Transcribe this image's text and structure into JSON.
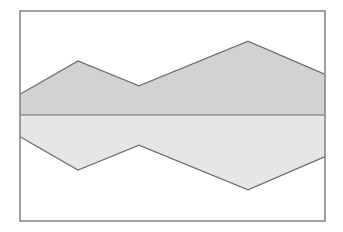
{
  "chart_data": {
    "type": "area",
    "title": "",
    "xlabel": "",
    "ylabel": "",
    "grid": false,
    "legend": null,
    "x": [
      0,
      1,
      2,
      3,
      4
    ],
    "baseline": 0,
    "ylim": [
      -100,
      100
    ],
    "series": [
      {
        "name": "upper",
        "direction": "above-baseline",
        "values": [
          20,
          52,
          28,
          71,
          39
        ],
        "color": "#d2d2d2"
      },
      {
        "name": "lower",
        "direction": "below-baseline",
        "values": [
          21,
          53,
          29,
          72,
          40
        ],
        "color": "#e6e6e6"
      }
    ]
  },
  "style": {
    "frame_color": "#808080",
    "line_color": "#6e6e6e",
    "upper_fill": "#d2d2d2",
    "lower_fill": "#e6e6e6"
  },
  "layout": {
    "plot": {
      "left": 20,
      "top": 11,
      "right": 325,
      "bottom": 221
    },
    "baseline_y": 115,
    "x_px": [
      20,
      78,
      139,
      248,
      325
    ]
  }
}
